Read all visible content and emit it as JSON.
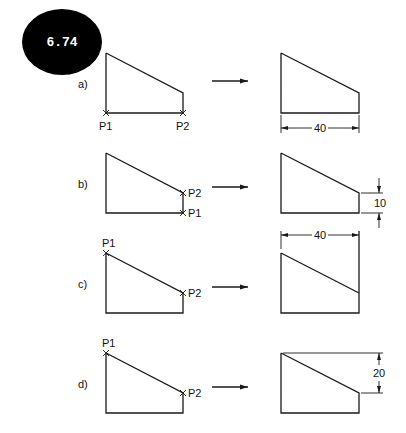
{
  "figure": {
    "badge": "6.74",
    "rows": [
      {
        "label": "a)",
        "points": [
          "P1",
          "P2"
        ],
        "result_dimension": "40"
      },
      {
        "label": "b)",
        "points": [
          "P2",
          "P1"
        ],
        "result_dimension": "10"
      },
      {
        "label": "c)",
        "points": [
          "P1",
          "P2"
        ],
        "result_dimension": "40"
      },
      {
        "label": "d)",
        "points": [
          "P1",
          "P2"
        ],
        "result_dimension": "20"
      }
    ]
  }
}
